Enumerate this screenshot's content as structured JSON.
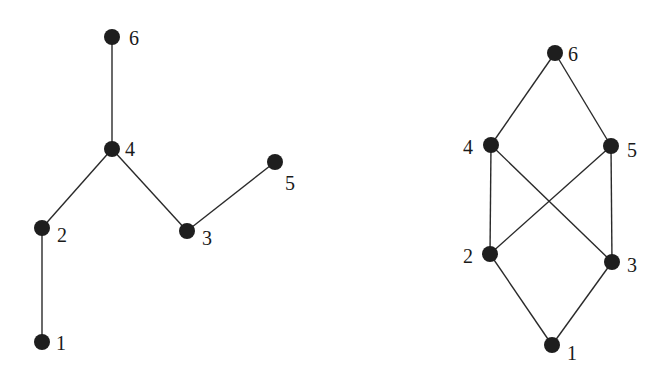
{
  "diagrams": [
    {
      "name": "tree",
      "nodes": [
        {
          "id": "1",
          "label": "1",
          "x": 42,
          "y": 342,
          "lx": 56,
          "ly": 350
        },
        {
          "id": "2",
          "label": "2",
          "x": 42,
          "y": 228,
          "lx": 57,
          "ly": 242
        },
        {
          "id": "3",
          "label": "3",
          "x": 187,
          "y": 231,
          "lx": 202,
          "ly": 245
        },
        {
          "id": "4",
          "label": "4",
          "x": 112,
          "y": 149,
          "lx": 125,
          "ly": 156
        },
        {
          "id": "5",
          "label": "5",
          "x": 275,
          "y": 162,
          "lx": 285,
          "ly": 190
        },
        {
          "id": "6",
          "label": "6",
          "x": 112,
          "y": 37,
          "lx": 129,
          "ly": 45
        }
      ],
      "edges": [
        [
          "1",
          "2"
        ],
        [
          "2",
          "4"
        ],
        [
          "4",
          "6"
        ],
        [
          "4",
          "3"
        ],
        [
          "3",
          "5"
        ]
      ]
    },
    {
      "name": "lattice",
      "nodes": [
        {
          "id": "1",
          "label": "1",
          "x": 552,
          "y": 345,
          "lx": 567,
          "ly": 360
        },
        {
          "id": "2",
          "label": "2",
          "x": 490,
          "y": 254,
          "lx": 463,
          "ly": 263
        },
        {
          "id": "3",
          "label": "3",
          "x": 612,
          "y": 262,
          "lx": 627,
          "ly": 272
        },
        {
          "id": "4",
          "label": "4",
          "x": 491,
          "y": 145,
          "lx": 463,
          "ly": 154
        },
        {
          "id": "5",
          "label": "5",
          "x": 611,
          "y": 146,
          "lx": 627,
          "ly": 157
        },
        {
          "id": "6",
          "label": "6",
          "x": 555,
          "y": 53,
          "lx": 568,
          "ly": 61
        }
      ],
      "edges": [
        [
          "1",
          "2"
        ],
        [
          "1",
          "3"
        ],
        [
          "2",
          "4"
        ],
        [
          "2",
          "5"
        ],
        [
          "3",
          "4"
        ],
        [
          "3",
          "5"
        ],
        [
          "4",
          "6"
        ],
        [
          "5",
          "6"
        ]
      ]
    }
  ]
}
